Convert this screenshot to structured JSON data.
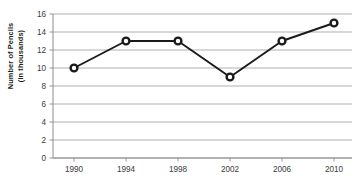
{
  "chart_data": {
    "type": "line",
    "title": "",
    "subtitle": "",
    "xlabel": "",
    "ylabel": "Number of Pencils (in thousands)",
    "ylabel_line1": "Number of Pencils",
    "ylabel_line2": "(in thousands)",
    "categories": [
      "1990",
      "1994",
      "1998",
      "2002",
      "2006",
      "2010"
    ],
    "x": [
      1990,
      1994,
      1998,
      2002,
      2006,
      2010
    ],
    "values": [
      10,
      13,
      13,
      9,
      13,
      15
    ],
    "series": [
      {
        "name": "Number of Pencils",
        "values": [
          10,
          13,
          13,
          9,
          13,
          15
        ]
      }
    ],
    "ylim": [
      0,
      16
    ],
    "y_ticks": [
      0,
      2,
      4,
      6,
      8,
      10,
      12,
      14,
      16
    ],
    "y_tick_labels": [
      "0",
      "2",
      "4",
      "6",
      "8",
      "10",
      "12",
      "14",
      "16"
    ],
    "x_tick_labels": [
      "1990",
      "1994",
      "1998",
      "2002",
      "2006",
      "2010"
    ],
    "grid": "horizontal",
    "legend": "none",
    "annotations": [],
    "colors": {
      "line": "#1a1a1a",
      "marker_stroke": "#1a1a1a",
      "marker_fill": "#ffffff",
      "grid": "#a6a6a6",
      "axis": "#8c8c8c",
      "text": "#3b3b3b",
      "axis_title": "#231f20",
      "background": "#ffffff"
    }
  }
}
